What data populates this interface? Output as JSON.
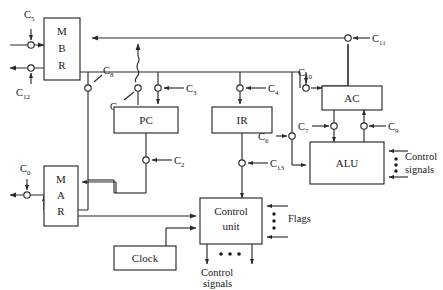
{
  "diagram": {
    "boxes": [
      {
        "id": "mbr",
        "label": "M B R",
        "lines": [
          "M",
          "B",
          "R"
        ]
      },
      {
        "id": "pc",
        "label": "PC",
        "lines": [
          "PC"
        ]
      },
      {
        "id": "ir",
        "label": "IR",
        "lines": [
          "IR"
        ]
      },
      {
        "id": "ac",
        "label": "AC",
        "lines": [
          "AC"
        ]
      },
      {
        "id": "alu",
        "label": "ALU",
        "lines": [
          "ALU"
        ]
      },
      {
        "id": "mar",
        "label": "M A R",
        "lines": [
          "M",
          "A",
          "R"
        ]
      },
      {
        "id": "control-unit",
        "label": "Control unit",
        "lines": [
          "Control",
          "unit"
        ]
      },
      {
        "id": "clock",
        "label": "Clock",
        "lines": [
          "Clock"
        ]
      }
    ],
    "control_signals": [
      {
        "id": "c5",
        "base": "C",
        "sub": "5"
      },
      {
        "id": "c12",
        "base": "C",
        "sub": "12"
      },
      {
        "id": "c8",
        "base": "C",
        "sub": "8"
      },
      {
        "id": "c1",
        "base": "C",
        "sub": "1"
      },
      {
        "id": "c3",
        "base": "C",
        "sub": "3"
      },
      {
        "id": "c4",
        "base": "C",
        "sub": "4"
      },
      {
        "id": "c10",
        "base": "C",
        "sub": "10"
      },
      {
        "id": "c11",
        "base": "C",
        "sub": "11"
      },
      {
        "id": "c7",
        "base": "C",
        "sub": "7"
      },
      {
        "id": "c9",
        "base": "C",
        "sub": "9"
      },
      {
        "id": "c0",
        "base": "C",
        "sub": "0"
      },
      {
        "id": "c2",
        "base": "C",
        "sub": "2"
      },
      {
        "id": "c6",
        "base": "C",
        "sub": "6"
      },
      {
        "id": "c13",
        "base": "C",
        "sub": "13"
      }
    ],
    "text_labels": {
      "flags": "Flags",
      "control_signals_right_1": "Control",
      "control_signals_right_2": "signals",
      "control_signals_bottom_1": "Control",
      "control_signals_bottom_2": "signals"
    },
    "colors": {
      "background": "#ffffff",
      "stroke": "#2a2a2a",
      "text": "#1a1a1a"
    }
  }
}
